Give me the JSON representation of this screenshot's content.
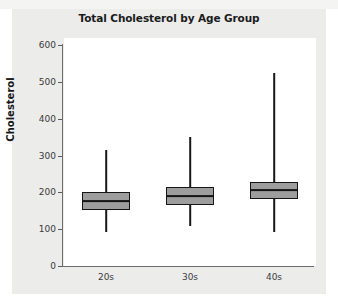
{
  "chart_data": {
    "type": "box",
    "title": "Total Cholesterol by Age Group",
    "xlabel": "",
    "ylabel": "Cholesterol",
    "categories": [
      "20s",
      "30s",
      "40s"
    ],
    "ylim": [
      0,
      620
    ],
    "yticks": [
      0,
      100,
      200,
      300,
      400,
      500,
      600
    ],
    "ytick_labels": [
      "0",
      "100",
      "200",
      "300",
      "400",
      "500",
      "600"
    ],
    "grid": false,
    "legend": null,
    "box_fill_color": "#9d9d9d",
    "box_edge_color": "#151515",
    "panel_background_color": "#ececeb",
    "plot_background_color": "#ffffff",
    "boxes": [
      {
        "category": "20s",
        "whisker_low": 93,
        "q1": 152,
        "median": 177,
        "q3": 202,
        "whisker_high": 315
      },
      {
        "category": "30s",
        "whisker_low": 108,
        "q1": 166,
        "median": 191,
        "q3": 215,
        "whisker_high": 352
      },
      {
        "category": "40s",
        "whisker_low": 93,
        "q1": 183,
        "median": 207,
        "q3": 228,
        "whisker_high": 525
      }
    ]
  }
}
